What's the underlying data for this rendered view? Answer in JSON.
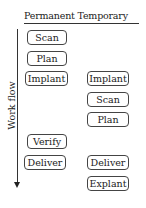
{
  "header": {
    "columns_label": "Permanent Temporary"
  },
  "axis": {
    "label": "Work flow"
  },
  "permanent": [
    {
      "label": "Scan"
    },
    {
      "label": "Plan"
    },
    {
      "label": "Implant"
    },
    {
      "label": "Verify"
    },
    {
      "label": "Deliver"
    }
  ],
  "temporary": [
    {
      "label": "Implant"
    },
    {
      "label": "Scan"
    },
    {
      "label": "Plan"
    },
    {
      "label": "Deliver"
    },
    {
      "label": "Explant"
    }
  ]
}
